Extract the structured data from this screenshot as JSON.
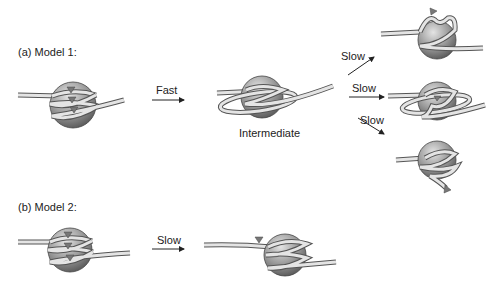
{
  "panels": {
    "a": {
      "label": "(a)  Model 1:"
    },
    "b": {
      "label": "(b)  Model 2:"
    }
  },
  "arrows": {
    "a_fast": "Fast",
    "a_slow_up": "Slow",
    "a_slow_mid": "Slow",
    "a_slow_down": "Slow",
    "b_slow": "Slow"
  },
  "captions": {
    "intermediate": "Intermediate"
  },
  "colors": {
    "sphere_light": "#d6d6d6",
    "sphere_dark": "#6e6e6e",
    "strand_fill": "#e2e2e2",
    "strand_stroke": "#555555",
    "marker": "#777777"
  }
}
